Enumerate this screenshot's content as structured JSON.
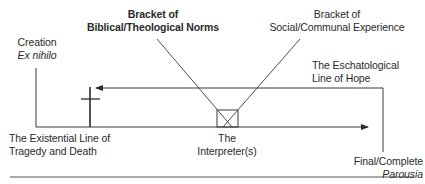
{
  "diagram": {
    "labels": {
      "creation": {
        "line1": "Creation",
        "line2": "Ex nihilo"
      },
      "biblical_bracket": {
        "line1": "Bracket of",
        "line2": "Biblical/Theological Norms"
      },
      "social_bracket": {
        "line1": "Bracket of",
        "line2": "Social/Communal Experience"
      },
      "eschatological": {
        "line1": "The Eschatological",
        "line2": "Line of Hope"
      },
      "existential": {
        "line1": "The Existential Line of",
        "line2": "Tragedy and Death"
      },
      "interpreter": {
        "line1": "The",
        "line2": "Interpreter(s)"
      },
      "parousia": {
        "line1": "Final/Complete",
        "line2": "Parousia"
      }
    },
    "colors": {
      "line": "#3a3a3a",
      "text": "#2a2a2a",
      "rule": "#555555"
    }
  }
}
